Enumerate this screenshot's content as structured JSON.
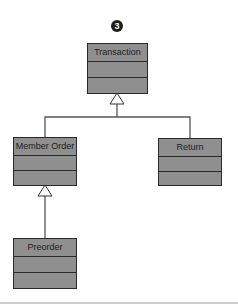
{
  "figure": {
    "badge": "3",
    "colors": {
      "box_fill": "#8f8f8f",
      "border": "#2a2a2a",
      "line": "#555555"
    }
  },
  "classes": [
    {
      "id": "transaction",
      "name": "Transaction"
    },
    {
      "id": "member-order",
      "name": "Member Order"
    },
    {
      "id": "return",
      "name": "Return"
    },
    {
      "id": "preorder",
      "name": "Preorder"
    }
  ],
  "relationships": [
    {
      "type": "generalization",
      "child": "Member Order",
      "parent": "Transaction"
    },
    {
      "type": "generalization",
      "child": "Return",
      "parent": "Transaction"
    },
    {
      "type": "generalization",
      "child": "Preorder",
      "parent": "Member Order"
    }
  ]
}
